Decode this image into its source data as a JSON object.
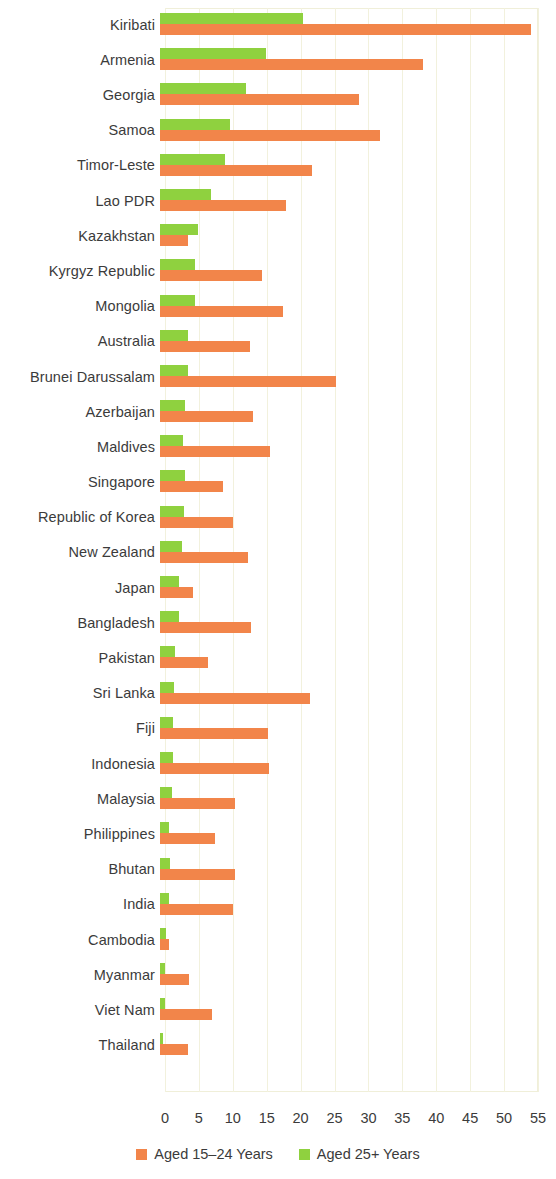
{
  "chart_data": {
    "type": "bar",
    "orientation": "horizontal",
    "title": "",
    "subtitle": "",
    "xlabel": "",
    "ylabel": "",
    "xlim": [
      0,
      55
    ],
    "xticks": [
      0,
      5,
      10,
      15,
      20,
      25,
      30,
      35,
      40,
      45,
      50,
      55
    ],
    "xtick_labels": [
      "0",
      "5",
      "10",
      "15",
      "20",
      "25",
      "30",
      "35",
      "40",
      "45",
      "50",
      "55"
    ],
    "grid": true,
    "legend_position": "bottom-center",
    "colors": {
      "aged_15_24": "#f2854a",
      "aged_25_plus": "#8fd13f",
      "gridline": "#f2f1dd",
      "text": "#3b3b3b",
      "background": "#ffffff"
    },
    "categories": [
      "Kiribati",
      "Armenia",
      "Georgia",
      "Samoa",
      "Timor-Leste",
      "Lao PDR",
      "Kazakhstan",
      "Kyrgyz Republic",
      "Mongolia",
      "Australia",
      "Brunei Darussalam",
      "Azerbaijan",
      "Maldives",
      "Singapore",
      "Republic of Korea",
      "New Zealand",
      "Japan",
      "Bangladesh",
      "Pakistan",
      "Sri Lanka",
      "Fiji",
      "Indonesia",
      "Malaysia",
      "Philippines",
      "Bhutan",
      "India",
      "Cambodia",
      "Myanmar",
      "Viet Nam",
      "Thailand"
    ],
    "series": [
      {
        "name": "Aged 15-24 Years",
        "color": "#f2854a",
        "values": [
          54.7,
          38.8,
          29.3,
          32.4,
          22.4,
          18.6,
          4.1,
          15.1,
          18.2,
          13.3,
          26.0,
          13.7,
          16.2,
          9.3,
          10.8,
          13.0,
          4.9,
          13.4,
          7.1,
          22.1,
          15.9,
          16.1,
          11.1,
          8.1,
          11.1,
          10.8,
          1.3,
          4.3,
          7.7,
          4.1
        ]
      },
      {
        "name": "Aged 25+ Years",
        "color": "#8fd13f",
        "values": [
          21.1,
          15.6,
          12.7,
          10.3,
          9.6,
          7.5,
          5.6,
          5.2,
          5.2,
          4.1,
          4.1,
          3.7,
          3.4,
          3.7,
          3.5,
          3.2,
          2.8,
          2.8,
          2.2,
          2.1,
          1.9,
          1.9,
          1.8,
          1.3,
          1.5,
          1.3,
          0.9,
          0.7,
          0.7,
          0.4
        ]
      }
    ]
  },
  "legend": {
    "items": [
      {
        "label": "Aged 15–24 Years",
        "color": "#f2854a"
      },
      {
        "label": "Aged 25+ Years",
        "color": "#8fd13f"
      }
    ]
  }
}
